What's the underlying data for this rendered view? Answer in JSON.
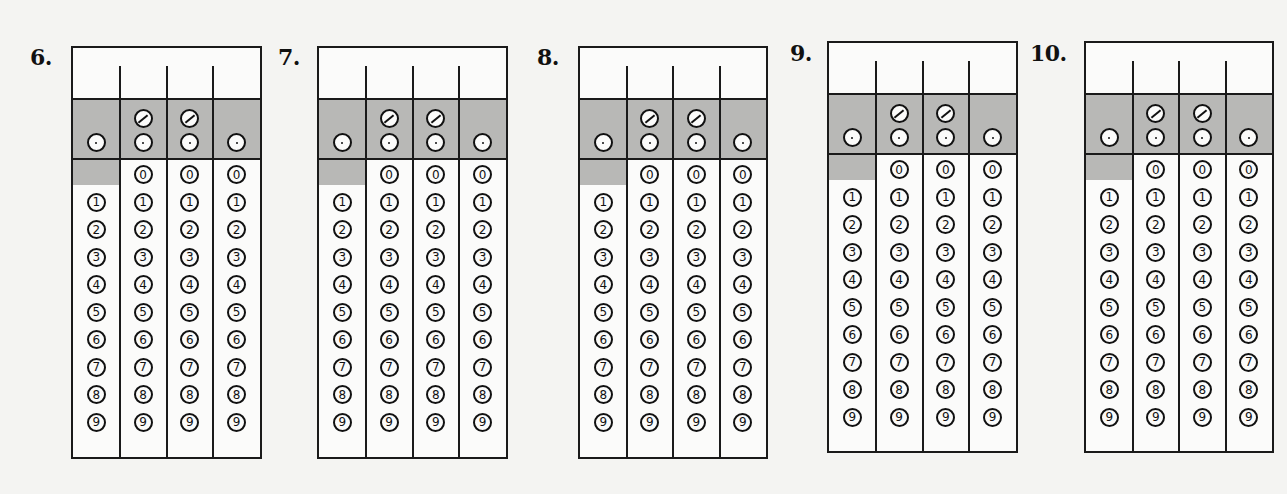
{
  "page": {
    "type": "grid-in answer sheet",
    "background": "#f4f4f2",
    "shade_color": "#b8b8b6",
    "line_color": "#1a1a1a"
  },
  "grids": [
    {
      "number": "6.",
      "label_x": 30,
      "label_y": 44,
      "x": 71,
      "y": 46,
      "w": 191,
      "h": 413
    },
    {
      "number": "7.",
      "label_x": 278,
      "label_y": 44,
      "x": 317,
      "y": 46,
      "w": 191,
      "h": 413
    },
    {
      "number": "8.",
      "label_x": 537,
      "label_y": 44,
      "x": 578,
      "y": 46,
      "w": 190,
      "h": 413
    },
    {
      "number": "9.",
      "label_x": 790,
      "label_y": 40,
      "x": 827,
      "y": 41,
      "w": 191,
      "h": 412
    },
    {
      "number": "10.",
      "label_x": 1030,
      "label_y": 40,
      "x": 1084,
      "y": 41,
      "w": 190,
      "h": 412
    }
  ],
  "grid_layout": {
    "columns": 4,
    "write_row_height": 52,
    "shaded_row_height": 60,
    "digit_row_pitch": 27.5,
    "first_column_shaded_cell_height": 25
  },
  "symbols": {
    "fraction_bar": "⊘",
    "decimal_point": "⊙",
    "fraction_columns": [
      1,
      2
    ],
    "decimal_columns": [
      0,
      1,
      2,
      3
    ]
  },
  "digits": [
    "0",
    "1",
    "2",
    "3",
    "4",
    "5",
    "6",
    "7",
    "8",
    "9"
  ],
  "column_digit_start": [
    1,
    0,
    0,
    0
  ]
}
